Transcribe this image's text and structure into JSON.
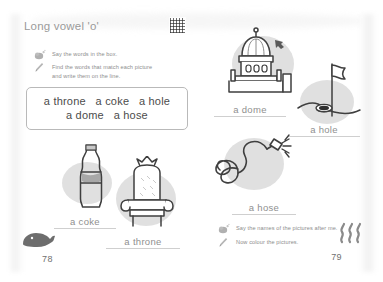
{
  "worksheet": {
    "title": "Long vowel 'o'",
    "qr_icon": "qr-code"
  },
  "left_page": {
    "page_number": "78",
    "corner_icon": "whale-icon",
    "instructions": [
      {
        "icon": "listen-icon",
        "text": "Say the words in the box."
      },
      {
        "icon": "pencil-icon",
        "text": "Find the words that match each picture\nand write them on the line."
      }
    ],
    "word_box": {
      "line1": "a throne   a coke   a hole",
      "line2": "a dome   a hose",
      "words": [
        "a throne",
        "a coke",
        "a hole",
        "a dome",
        "a hose"
      ]
    },
    "pictures": [
      {
        "icon": "coke-bottle-icon",
        "answer": "a coke"
      },
      {
        "icon": "throne-icon",
        "answer": "a throne"
      }
    ]
  },
  "right_page": {
    "page_number": "79",
    "corner_icon": "steam-icon",
    "pictures": [
      {
        "icon": "dome-icon",
        "answer": "a dome"
      },
      {
        "icon": "golf-hole-icon",
        "answer": "a hole"
      },
      {
        "icon": "hose-icon",
        "answer": "a hose"
      }
    ],
    "instructions": [
      {
        "icon": "listen-icon",
        "text": "Say the names of the pictures after me."
      },
      {
        "icon": "pencil-icon",
        "text": "Now colour the pictures."
      }
    ]
  },
  "colors": {
    "text_grey": "#8d8d8d",
    "word_text": "#4c4c4c",
    "blob": "#d6d6d6",
    "line": "#cfcfcf",
    "outline": "#3f3f3f"
  }
}
